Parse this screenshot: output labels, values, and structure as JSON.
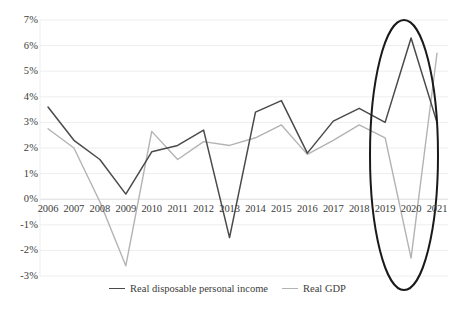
{
  "chart_data": {
    "type": "line",
    "title": "",
    "xlabel": "",
    "ylabel": "",
    "x": [
      2006,
      2007,
      2008,
      2009,
      2010,
      2011,
      2012,
      2013,
      2014,
      2015,
      2016,
      2017,
      2018,
      2019,
      2020,
      2021
    ],
    "categories": [
      "2006",
      "2007",
      "2008",
      "2009",
      "2010",
      "2011",
      "2012",
      "2013",
      "2014",
      "2015",
      "2016",
      "2017",
      "2018",
      "2019",
      "2020",
      "2021"
    ],
    "series": [
      {
        "name": "Real disposable personal income",
        "color": "#4a4a4a",
        "values": [
          3.6,
          2.3,
          1.55,
          0.2,
          1.85,
          2.1,
          2.7,
          -1.5,
          3.4,
          3.85,
          1.8,
          3.05,
          3.55,
          3.0,
          6.3,
          3.0
        ]
      },
      {
        "name": "Real GDP",
        "color": "#b3b3b3",
        "values": [
          2.75,
          2.0,
          -0.1,
          -2.6,
          2.65,
          1.55,
          2.25,
          2.1,
          2.4,
          2.9,
          1.75,
          2.3,
          2.9,
          2.4,
          -2.3,
          5.7
        ]
      }
    ],
    "ylim": [
      -3,
      7
    ],
    "yticks": [
      "7%",
      "6%",
      "5%",
      "4%",
      "3%",
      "2%",
      "1%",
      "0%",
      "-1%",
      "-2%",
      "-3%"
    ],
    "ytick_values": [
      7,
      6,
      5,
      4,
      3,
      2,
      1,
      0,
      -1,
      -2,
      -3
    ],
    "grid": true,
    "legend_position": "bottom",
    "annotations": [
      {
        "type": "ellipse",
        "label": "pandemic-period-highlight",
        "covers": [
          "2019",
          "2020",
          "2021"
        ],
        "color": "#1a1a1a"
      }
    ]
  },
  "legend": {
    "items": [
      {
        "label": "Real disposable personal income",
        "color": "#4a4a4a"
      },
      {
        "label": "Real GDP",
        "color": "#b3b3b3"
      }
    ]
  }
}
